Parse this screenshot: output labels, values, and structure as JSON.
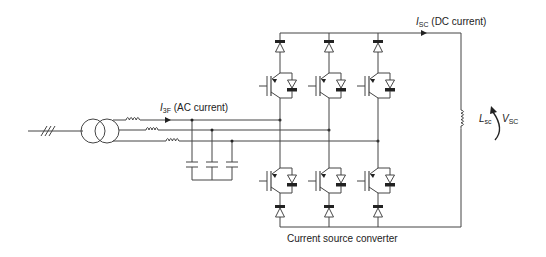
{
  "diagram": {
    "title": "Current source converter",
    "labels": {
      "ac_current_symbol": "I",
      "ac_current_sub": "3F",
      "ac_current_text": "(AC current)",
      "dc_current_symbol": "I",
      "dc_current_sub": "SC",
      "dc_current_text": "(DC current)",
      "inductor_symbol": "L",
      "inductor_sub": "sc",
      "voltage_symbol": "V",
      "voltage_sub": "SC",
      "converter_caption": "Current source converter"
    },
    "components": {
      "grid_feed": "three-phase line (///)",
      "transformer": "two-winding transformer",
      "ac_inductors": 3,
      "filter_capacitors": 3,
      "converter_legs": 3,
      "switches_per_leg": 2,
      "switch_type": "IGBT with anti-parallel diode and series diode",
      "dc_inductor": "Lsc"
    },
    "colors": {
      "line": "#333333",
      "background": "#ffffff"
    }
  }
}
